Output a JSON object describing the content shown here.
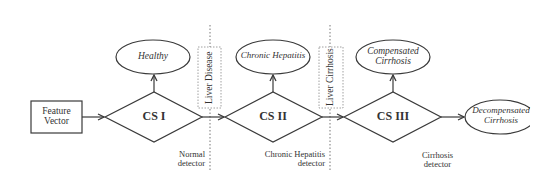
{
  "diagram": {
    "input": {
      "label_line1": "Feature",
      "label_line2": "Vector"
    },
    "classifiers": [
      {
        "id": "cs1",
        "label": "CS I",
        "detector_line1": "Normal",
        "detector_line2": "detector"
      },
      {
        "id": "cs2",
        "label": "CS II",
        "detector_line1": "Chronic Hepatitis",
        "detector_line2": "detector"
      },
      {
        "id": "cs3",
        "label": "CS III",
        "detector_line1": "Cirrhosis",
        "detector_line2": "detector"
      }
    ],
    "outcomes": [
      {
        "id": "healthy",
        "line1": "Healthy",
        "line2": ""
      },
      {
        "id": "chronic-hepatitis",
        "line1": "Chronic Hepatitis",
        "line2": ""
      },
      {
        "id": "compensated-cirrhosis",
        "line1": "Compensated",
        "line2": "Cirrhosis"
      },
      {
        "id": "decompensated-cirrhosis",
        "line1": "Decompensated",
        "line2": "Cirrhosis"
      }
    ],
    "boundaries": [
      {
        "id": "liver-disease",
        "label": "Liver Disease"
      },
      {
        "id": "liver-cirrhosis",
        "label": "Liver Cirrhosis"
      }
    ],
    "colors": {
      "stroke": "#3a3a3a",
      "dotted": "#777777",
      "background": "#ffffff"
    }
  }
}
